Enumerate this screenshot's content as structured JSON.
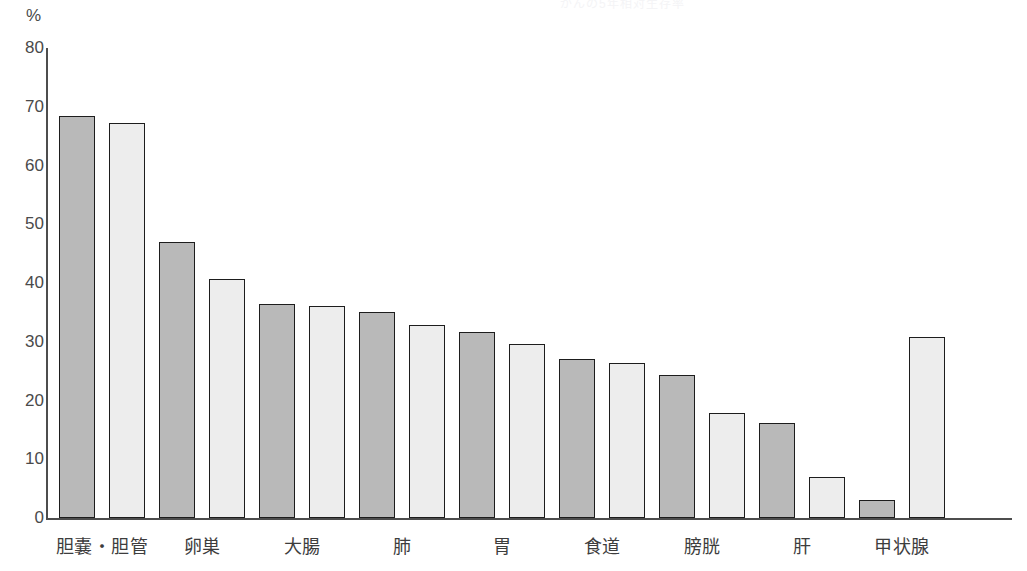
{
  "header": {
    "cut_off_title": "がんの5年相対生存率",
    "unit_label": "%"
  },
  "colors": {
    "bar_dark": "#b9b9b9",
    "bar_light": "#ededed",
    "bar_border": "#1d1d1d",
    "axis": "#4d4d4d",
    "text": "#3d3d3d",
    "background": "#ffffff"
  },
  "chart_data": {
    "type": "bar",
    "title": "がんの5年相対生存率",
    "xlabel": "",
    "ylabel": "%",
    "ylim": [
      0,
      80
    ],
    "yticks": [
      0,
      10,
      20,
      30,
      40,
      50,
      60,
      70,
      80
    ],
    "grid": false,
    "legend_position": "none",
    "categories": [
      "胆嚢・胆管",
      "卵巣",
      "大腸",
      "肺",
      "胃",
      "食道",
      "膀胱",
      "肝",
      "甲状腺"
    ],
    "series": [
      {
        "name": "男性",
        "fill": "#b9b9b9",
        "values": [
          68.4,
          47.0,
          36.5,
          35.0,
          31.6,
          27.1,
          24.3,
          16.1,
          3.1
        ]
      },
      {
        "name": "女性",
        "fill": "#ededed",
        "values": [
          67.2,
          40.7,
          36.1,
          32.8,
          29.7,
          26.4,
          17.8,
          7.0,
          30.8
        ]
      }
    ],
    "bars": [
      {
        "label": "胆嚢・胆管",
        "group": 0,
        "shade": "dark",
        "value": 68.4
      },
      {
        "label": "胆嚢・胆管",
        "group": 0,
        "shade": "light",
        "value": 67.2
      },
      {
        "label": "卵巣",
        "group": 1,
        "shade": "dark",
        "value": 47.0
      },
      {
        "label": "卵巣",
        "group": 1,
        "shade": "light",
        "value": 40.7
      },
      {
        "label": "大腸",
        "group": 2,
        "shade": "dark",
        "value": 36.5
      },
      {
        "label": "大腸",
        "group": 2,
        "shade": "light",
        "value": 36.1
      },
      {
        "label": "肺",
        "group": 3,
        "shade": "dark",
        "value": 35.0
      },
      {
        "label": "肺",
        "group": 3,
        "shade": "light",
        "value": 32.8
      },
      {
        "label": "胃",
        "group": 4,
        "shade": "dark",
        "value": 31.6
      },
      {
        "label": "胃",
        "group": 4,
        "shade": "light",
        "value": 29.7
      },
      {
        "label": "食道",
        "group": 5,
        "shade": "dark",
        "value": 27.1
      },
      {
        "label": "食道",
        "group": 5,
        "shade": "light",
        "value": 26.4
      },
      {
        "label": "膀胱",
        "group": 6,
        "shade": "dark",
        "value": 24.3
      },
      {
        "label": "膀胱",
        "group": 6,
        "shade": "light",
        "value": 17.8
      },
      {
        "label": "肝",
        "group": 7,
        "shade": "dark",
        "value": 16.1
      },
      {
        "label": "肝",
        "group": 7,
        "shade": "light",
        "value": 7.0
      },
      {
        "label": "甲状腺",
        "group": 8,
        "shade": "dark",
        "value": 3.1
      },
      {
        "label": "甲状腺",
        "group": 8,
        "shade": "light",
        "value": 30.8
      }
    ]
  },
  "geometry": {
    "plot_left": 46,
    "plot_right": 1012,
    "plot_top": 48,
    "plot_bottom": 518,
    "bar_width": 36,
    "bar_pitch": 50,
    "first_bar_left": 59
  }
}
